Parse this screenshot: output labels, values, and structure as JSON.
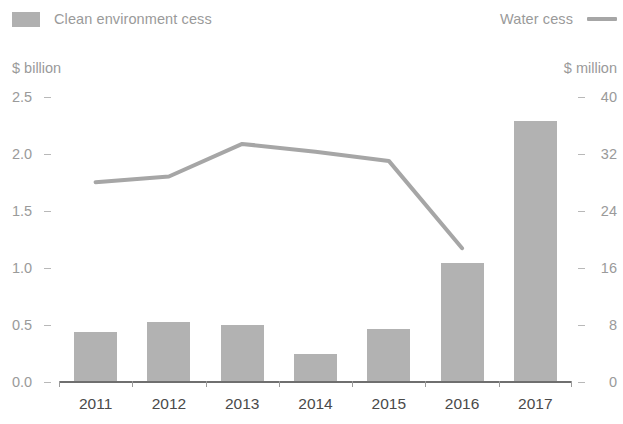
{
  "legend": {
    "bar_series": {
      "label": "Clean environment cess",
      "icon": "bar-swatch",
      "color": "#b0b0b0"
    },
    "line_series": {
      "label": "Water cess",
      "icon": "line-swatch",
      "color": "#a6a6a6"
    }
  },
  "axes": {
    "left_unit": "$ billion",
    "right_unit": "$ million",
    "left_ticks": [
      "2.5",
      "2.0",
      "1.5",
      "1.0",
      "0.5",
      "0.0"
    ],
    "right_ticks": [
      "40",
      "32",
      "24",
      "16",
      "8",
      "0"
    ],
    "x_ticks": [
      "2011",
      "2012",
      "2013",
      "2014",
      "2015",
      "2016",
      "2017"
    ]
  },
  "chart_data": {
    "type": "bar",
    "title": "",
    "xlabel": "",
    "ylabel": "$ billion",
    "y2label": "$ million",
    "categories": [
      "2011",
      "2012",
      "2013",
      "2014",
      "2015",
      "2016",
      "2017"
    ],
    "ylim": [
      0,
      2.5
    ],
    "y2lim": [
      0,
      40
    ],
    "grid": false,
    "legend_position": "top",
    "series": [
      {
        "name": "Clean environment cess",
        "type": "bar",
        "axis": "left",
        "unit": "$ billion",
        "color": "#b2b2b2",
        "values": [
          0.43,
          0.52,
          0.49,
          0.24,
          0.46,
          1.04,
          2.29
        ]
      },
      {
        "name": "Water cess",
        "type": "line",
        "axis": "right",
        "unit": "$ million",
        "color": "#a6a6a6",
        "x": [
          "2011",
          "2012",
          "2013",
          "2014",
          "2015",
          "2016"
        ],
        "values": [
          28.0,
          28.8,
          33.4,
          32.3,
          31.0,
          18.7
        ]
      }
    ]
  }
}
